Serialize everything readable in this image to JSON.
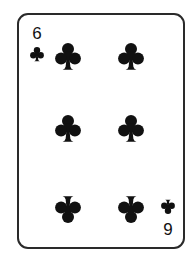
{
  "card": {
    "rank": "6",
    "suit": "clubs",
    "suit_icon": "club-icon",
    "suit_color": "#111111",
    "border_color": "#2a2a2a",
    "background": "#ffffff",
    "corner_top_left": {
      "rank_label": "6"
    },
    "corner_bottom_right": {
      "rank_label": "6",
      "rendered_inverted_as": "9"
    },
    "pip_count": 6,
    "pip_layout": [
      {
        "row": 1,
        "col": 1,
        "inverted": false
      },
      {
        "row": 1,
        "col": 2,
        "inverted": false
      },
      {
        "row": 2,
        "col": 1,
        "inverted": false
      },
      {
        "row": 2,
        "col": 2,
        "inverted": false
      },
      {
        "row": 3,
        "col": 1,
        "inverted": true
      },
      {
        "row": 3,
        "col": 2,
        "inverted": true
      }
    ]
  }
}
